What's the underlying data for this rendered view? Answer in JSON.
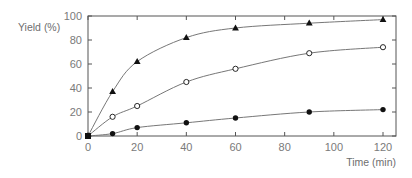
{
  "chart_data": {
    "type": "line",
    "title": "",
    "xlabel": "Time (min)",
    "ylabel": "Yield (%)",
    "xlim": [
      0,
      125
    ],
    "ylim": [
      0,
      100
    ],
    "xticks": [
      0,
      20,
      40,
      60,
      80,
      100,
      120
    ],
    "yticks": [
      0,
      20,
      40,
      60,
      80,
      100
    ],
    "grid": false,
    "legend": null,
    "x": [
      0,
      10,
      20,
      40,
      60,
      90,
      120
    ],
    "series": [
      {
        "name": "filled-triangle",
        "marker": "triangle-filled",
        "values": [
          0,
          37,
          62,
          82,
          90,
          94,
          97
        ]
      },
      {
        "name": "open-circle",
        "marker": "circle-open",
        "values": [
          0,
          16,
          25,
          45,
          56,
          69,
          74
        ]
      },
      {
        "name": "filled-circle",
        "marker": "circle-filled",
        "values": [
          0,
          2,
          7,
          11,
          15,
          20,
          22
        ]
      }
    ]
  },
  "colors": {
    "axis": "#555555",
    "line": "#777777",
    "marker": "#111111",
    "text": "#777777"
  }
}
